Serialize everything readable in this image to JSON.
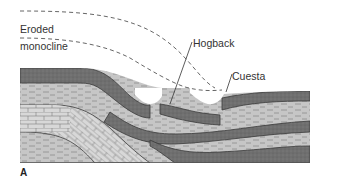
{
  "figure": {
    "panel_letter": "A",
    "labels": {
      "eroded_line1": "Eroded",
      "eroded_line2": "monocline",
      "hogback": "Hogback",
      "cuesta": "Cuesta"
    },
    "colors": {
      "sandstone_dark": "#6e6e6e",
      "shale_light": "#c4c4c4",
      "limestone": "#d6d6d6",
      "outline": "#3a3a3a",
      "dash": "#555555",
      "text": "#333333"
    }
  }
}
